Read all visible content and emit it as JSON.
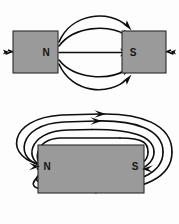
{
  "figure": {
    "background_color": "#fdfdfd",
    "line_color": "#0d0d0d",
    "magnet_fill_color": "#9a9a9a",
    "magnet_stroke_color": "#2b2b2b",
    "label_color": "#151515",
    "panels": [
      {
        "name": "two-magnets-attracting",
        "description": "Two separate bar magnets facing each other, north pole on the left and south pole on the right, with magnetic field lines running from N to S across the gap.",
        "magnets": [
          {
            "name": "left-magnet",
            "pole_label": "N",
            "pole_label_side": "right",
            "x": 13,
            "y": 31,
            "width": 45,
            "height": 42
          },
          {
            "name": "right-magnet",
            "pole_label": "S",
            "pole_label_side": "left",
            "x": 122,
            "y": 31,
            "width": 44,
            "height": 42
          }
        ],
        "field_lines": [
          {
            "name": "upper-outer-arc",
            "curvature": "strong-up",
            "arrow_at": "end"
          },
          {
            "name": "upper-inner-arc",
            "curvature": "mild-up",
            "arrow_at": "end"
          },
          {
            "name": "center-straight-line",
            "curvature": "none",
            "arrow_at": "end"
          },
          {
            "name": "lower-inner-arc",
            "curvature": "mild-down",
            "arrow_at": "end"
          },
          {
            "name": "lower-outer-arc",
            "curvature": "strong-down",
            "arrow_at": "end"
          }
        ],
        "external_arrows": [
          {
            "name": "left-stub-arrow",
            "direction": "left"
          },
          {
            "name": "right-stub-arrow",
            "direction": "right"
          }
        ]
      },
      {
        "name": "single-bar-magnet-loops",
        "description": "A single horizontal bar magnet with north pole at the left end and south pole at the right end, surrounded by closed loops of magnetic field lines leaving N and entering S.",
        "magnets": [
          {
            "name": "bar-magnet",
            "pole_label_left": "N",
            "pole_label_right": "S",
            "x": 38,
            "y": 145,
            "width": 106,
            "height": 48
          }
        ],
        "field_lines": [
          {
            "name": "outer-loop",
            "arrow_top": "right",
            "arrow_bottom": "right"
          },
          {
            "name": "middle-loop",
            "arrow_top": "right",
            "arrow_bottom": "right"
          },
          {
            "name": "inner-loop",
            "arrow_top": "right",
            "arrow_bottom": "right"
          },
          {
            "name": "innermost-loop",
            "arrow_top": "none",
            "arrow_bottom": "none"
          }
        ]
      }
    ]
  },
  "labels": {
    "top_left_pole": "N",
    "top_right_pole": "S",
    "bottom_left_pole": "N",
    "bottom_right_pole": "S"
  }
}
